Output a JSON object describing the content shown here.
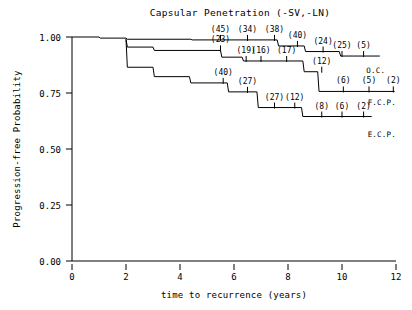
{
  "chart_data": {
    "type": "line",
    "title": "Capsular Penetration (-SV,-LN)",
    "xlabel": "time to recurrence (years)",
    "ylabel": "Progression-free Probability",
    "xlim": [
      0,
      12
    ],
    "ylim": [
      0.0,
      1.0
    ],
    "xticks": [
      0,
      2,
      4,
      6,
      8,
      10,
      12
    ],
    "xtick_labels": [
      "0",
      "2",
      "4",
      "6",
      "8",
      "10",
      "12"
    ],
    "yticks": [
      0.0,
      0.25,
      0.5,
      0.75,
      1.0
    ],
    "ytick_labels": [
      "0.00",
      "0.25",
      "0.50",
      "0.75",
      "1.00"
    ],
    "grid": false,
    "legend_position": "right-inline",
    "series": [
      {
        "name": "O.C.",
        "label": "O.C.",
        "label_x": 10.9,
        "label_y": 0.838,
        "steps": [
          {
            "x": 0.0,
            "y": 1.0
          },
          {
            "x": 1.0,
            "y": 1.0
          },
          {
            "x": 1.05,
            "y": 0.995
          },
          {
            "x": 2.0,
            "y": 0.995
          },
          {
            "x": 2.05,
            "y": 0.99
          },
          {
            "x": 4.4,
            "y": 0.99
          },
          {
            "x": 4.45,
            "y": 0.987
          },
          {
            "x": 7.6,
            "y": 0.987
          },
          {
            "x": 7.65,
            "y": 0.96
          },
          {
            "x": 8.6,
            "y": 0.96
          },
          {
            "x": 8.65,
            "y": 0.935
          },
          {
            "x": 9.9,
            "y": 0.935
          },
          {
            "x": 9.95,
            "y": 0.915
          },
          {
            "x": 11.4,
            "y": 0.915
          }
        ],
        "censor_marks": [
          {
            "x": 5.5,
            "y": 0.987,
            "n": "(45)"
          },
          {
            "x": 6.5,
            "y": 0.987,
            "n": "(34)"
          },
          {
            "x": 7.5,
            "y": 0.987,
            "n": "(38)"
          },
          {
            "x": 8.35,
            "y": 0.96,
            "n": "(40)"
          },
          {
            "x": 9.3,
            "y": 0.935,
            "n": "(24)"
          },
          {
            "x": 10.0,
            "y": 0.915,
            "n": "(25)"
          },
          {
            "x": 10.8,
            "y": 0.915,
            "n": "(5)"
          }
        ]
      },
      {
        "name": "F.C.P.",
        "label": "F.C.P.",
        "label_x": 10.95,
        "label_y": 0.695,
        "steps": [
          {
            "x": 2.0,
            "y": 0.99
          },
          {
            "x": 2.05,
            "y": 0.955
          },
          {
            "x": 3.0,
            "y": 0.955
          },
          {
            "x": 3.05,
            "y": 0.94
          },
          {
            "x": 5.5,
            "y": 0.94
          },
          {
            "x": 5.55,
            "y": 0.91
          },
          {
            "x": 6.3,
            "y": 0.91
          },
          {
            "x": 6.35,
            "y": 0.893
          },
          {
            "x": 8.55,
            "y": 0.893
          },
          {
            "x": 8.6,
            "y": 0.845
          },
          {
            "x": 9.1,
            "y": 0.845
          },
          {
            "x": 9.15,
            "y": 0.757
          },
          {
            "x": 11.95,
            "y": 0.757
          }
        ],
        "censor_marks": [
          {
            "x": 5.5,
            "y": 0.94,
            "n": "(23)"
          },
          {
            "x": 6.45,
            "y": 0.893,
            "n": "(19)"
          },
          {
            "x": 7.0,
            "y": 0.893,
            "n": "(16)"
          },
          {
            "x": 7.95,
            "y": 0.893,
            "n": "(17)"
          },
          {
            "x": 9.25,
            "y": 0.845,
            "n": "(12)"
          },
          {
            "x": 10.05,
            "y": 0.757,
            "n": "(6)"
          },
          {
            "x": 11.0,
            "y": 0.757,
            "n": "(5)"
          },
          {
            "x": 11.9,
            "y": 0.757,
            "n": "(2)"
          }
        ]
      },
      {
        "name": "E.C.P.",
        "label": "E.C.P.",
        "label_x": 10.95,
        "label_y": 0.555,
        "steps": [
          {
            "x": 2.0,
            "y": 0.99
          },
          {
            "x": 2.05,
            "y": 0.865
          },
          {
            "x": 3.0,
            "y": 0.865
          },
          {
            "x": 3.05,
            "y": 0.823
          },
          {
            "x": 4.35,
            "y": 0.823
          },
          {
            "x": 4.4,
            "y": 0.795
          },
          {
            "x": 5.75,
            "y": 0.795
          },
          {
            "x": 5.8,
            "y": 0.755
          },
          {
            "x": 6.85,
            "y": 0.755
          },
          {
            "x": 6.9,
            "y": 0.685
          },
          {
            "x": 8.5,
            "y": 0.685
          },
          {
            "x": 8.55,
            "y": 0.645
          },
          {
            "x": 11.1,
            "y": 0.645
          }
        ],
        "censor_marks": [
          {
            "x": 5.6,
            "y": 0.795,
            "n": "(40)"
          },
          {
            "x": 6.5,
            "y": 0.755,
            "n": "(27)"
          },
          {
            "x": 7.5,
            "y": 0.685,
            "n": "(27)"
          },
          {
            "x": 8.25,
            "y": 0.685,
            "n": "(12)"
          },
          {
            "x": 9.25,
            "y": 0.645,
            "n": "(8)"
          },
          {
            "x": 10.0,
            "y": 0.645,
            "n": "(6)"
          },
          {
            "x": 10.8,
            "y": 0.645,
            "n": "(2)"
          }
        ]
      }
    ]
  }
}
